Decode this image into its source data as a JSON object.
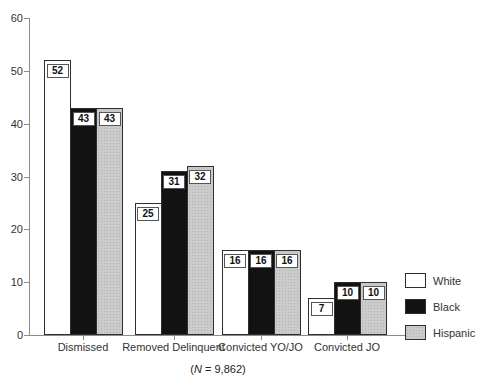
{
  "figure": {
    "caption": {
      "open": "(",
      "n": "N",
      "rest": " = 9,862)"
    }
  },
  "chart_data": {
    "type": "bar",
    "title": "",
    "xlabel": "",
    "ylabel": "",
    "categories": [
      "Dismissed",
      "Removed Delinquent",
      "Convicted YO/JO",
      "Convicted JO"
    ],
    "series": [
      {
        "name": "White",
        "color": "#ffffff",
        "values": [
          52,
          25,
          16,
          7
        ]
      },
      {
        "name": "Black",
        "color": "#121212",
        "values": [
          43,
          31,
          16,
          10
        ]
      },
      {
        "name": "Hispanic",
        "color": "#cbcbcb",
        "values": [
          43,
          32,
          16,
          10
        ]
      }
    ],
    "ylim": [
      0,
      60
    ],
    "yticks": [
      0,
      10,
      20,
      30,
      40,
      50,
      60
    ],
    "grid": false,
    "value_labels": true,
    "legend": {
      "position": "right",
      "entries": [
        "White",
        "Black",
        "Hispanic"
      ]
    },
    "caption": "(N = 9,862)"
  },
  "colors": {
    "axis": "#8c8c8c",
    "text": "#333333",
    "bar_border": "#2e2e2e",
    "label_box_border": "#555555",
    "background": "#ffffff"
  }
}
